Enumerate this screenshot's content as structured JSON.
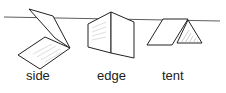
{
  "figure": {
    "labels": {
      "side": "side",
      "edge": "edge",
      "tent": "tent"
    },
    "stroke_color": "#222222",
    "background": "#ffffff"
  }
}
